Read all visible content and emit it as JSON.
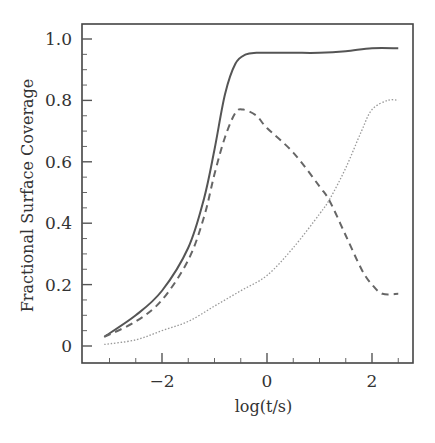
{
  "chart_data": {
    "type": "line",
    "title": "",
    "xlabel": "log(t/s)",
    "ylabel": "Fractional Surface Coverage",
    "xlim": [
      -3.37,
      2.78
    ],
    "ylim": [
      -0.055,
      1.048
    ],
    "x_ticks": [
      -2,
      0,
      2
    ],
    "x_tick_labels": [
      "−2",
      "0",
      "2"
    ],
    "x_minor_step": 0.5,
    "y_ticks": [
      0,
      0.2,
      0.4,
      0.6,
      0.8,
      1.0
    ],
    "y_tick_labels": [
      "0",
      "0.2",
      "0.4",
      "0.6",
      "0.8",
      "1.0"
    ],
    "y_minor_step": 0.05,
    "grid": false,
    "legend": null,
    "series": [
      {
        "name": "solid",
        "style": "solid",
        "color": "#555555",
        "x": [
          -3.1,
          -2.5,
          -2.0,
          -1.5,
          -1.2,
          -1.0,
          -0.8,
          -0.6,
          -0.4,
          -0.2,
          0.0,
          0.5,
          1.0,
          1.5,
          2.0,
          2.5
        ],
        "y": [
          0.03,
          0.1,
          0.18,
          0.32,
          0.48,
          0.64,
          0.82,
          0.92,
          0.95,
          0.955,
          0.955,
          0.955,
          0.955,
          0.96,
          0.97,
          0.97
        ]
      },
      {
        "name": "dashed",
        "style": "dashed",
        "color": "#666666",
        "x": [
          -3.1,
          -2.5,
          -2.0,
          -1.5,
          -1.2,
          -1.0,
          -0.8,
          -0.6,
          -0.45,
          -0.2,
          0.0,
          0.5,
          1.0,
          1.2,
          1.5,
          1.8,
          2.0,
          2.2,
          2.5
        ],
        "y": [
          0.03,
          0.08,
          0.15,
          0.28,
          0.42,
          0.56,
          0.68,
          0.76,
          0.77,
          0.75,
          0.71,
          0.63,
          0.52,
          0.47,
          0.36,
          0.25,
          0.2,
          0.17,
          0.17
        ]
      },
      {
        "name": "dotted",
        "style": "dotted",
        "color": "#999999",
        "x": [
          -3.1,
          -2.5,
          -2.0,
          -1.5,
          -1.0,
          -0.5,
          0.0,
          0.5,
          1.0,
          1.2,
          1.5,
          1.8,
          2.0,
          2.3,
          2.5
        ],
        "y": [
          0.005,
          0.02,
          0.05,
          0.08,
          0.13,
          0.18,
          0.23,
          0.32,
          0.43,
          0.48,
          0.58,
          0.7,
          0.77,
          0.8,
          0.8
        ]
      }
    ]
  },
  "layout": {
    "plot_left": 82,
    "plot_right": 413,
    "plot_top": 24,
    "plot_bottom": 363,
    "x0_px": 267,
    "x_px_per_unit": 52.5,
    "y0_px": 346,
    "y_px_per_unit": 307
  }
}
